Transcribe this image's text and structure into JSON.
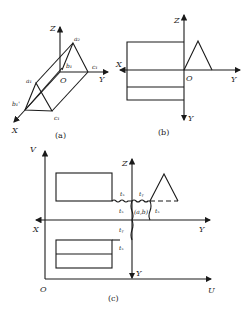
{
  "panels": {
    "a": {
      "caption": "(a)",
      "axes": {
        "z": "Z",
        "y": "Y",
        "x": "X",
        "origin": "O"
      },
      "points": {
        "a2": "a₂",
        "b1": "b₁",
        "c1_top": "c₁",
        "a1": "a₁",
        "b1_prime": "b₁'",
        "c1_bottom": "c₁"
      }
    },
    "b": {
      "caption": "(b)",
      "axes": {
        "z": "Z",
        "x": "X",
        "origin": "O",
        "y_right": "Y",
        "y_down": "Y"
      }
    },
    "c": {
      "caption": "(c)",
      "axes": {
        "v": "V",
        "u": "U",
        "origin": "O",
        "z": "Z",
        "x": "X",
        "y_right": "Y",
        "y_down": "Y"
      },
      "offsets": {
        "tx_top": "tₓ",
        "ty_top": "tᵧ",
        "tx_left": "tₓ",
        "tx_right": "tₓ",
        "ty_mid": "tᵧ",
        "tx_low": "tₓ"
      },
      "center_label": "(a,b)"
    }
  }
}
